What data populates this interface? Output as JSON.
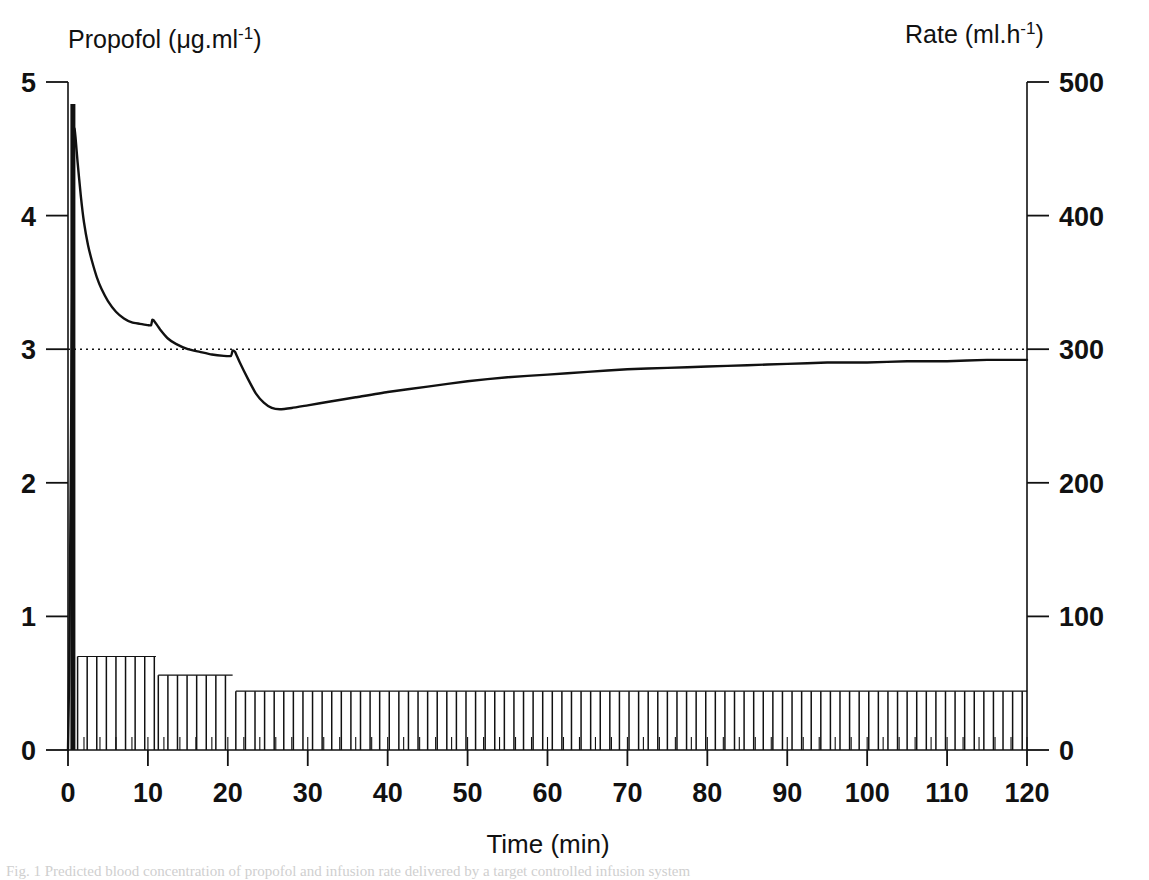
{
  "figure": {
    "left_axis_label_main": "Propofol (",
    "left_axis_label_unit": "μg.ml",
    "left_axis_label_exp": "-1",
    "left_axis_label_close": ")",
    "right_axis_label_main": "Rate (ml.h",
    "right_axis_label_exp": "-1",
    "right_axis_label_close": ")",
    "x_axis_label": "Time (min)",
    "footer_caption": "Fig. 1 Predicted blood concentration of propofol and infusion rate delivered by a target controlled infusion system"
  },
  "chart_data": {
    "type": "line",
    "title": "",
    "xlabel": "Time (min)",
    "ylabel": "Propofol (μg.ml-1)",
    "y2label": "Rate (ml.h-1)",
    "xlim": [
      0,
      120
    ],
    "ylim": [
      0,
      5
    ],
    "y2lim": [
      0,
      500
    ],
    "xticks": [
      0,
      10,
      20,
      30,
      40,
      50,
      60,
      70,
      80,
      90,
      100,
      110,
      120
    ],
    "xticklabels": [
      "0",
      "10",
      "20",
      "30",
      "40",
      "50",
      "60",
      "70",
      "80",
      "90",
      "100",
      "110",
      "120"
    ],
    "yticks": [
      0,
      1,
      2,
      3,
      4,
      5
    ],
    "yticklabels": [
      "0",
      "1",
      "2",
      "3",
      "4",
      "5"
    ],
    "y2ticks": [
      0,
      100,
      200,
      300,
      400,
      500
    ],
    "y2ticklabels": [
      "0",
      "100",
      "200",
      "300",
      "400",
      "500"
    ],
    "x_minor_tick_interval": 2,
    "grid": false,
    "legend": null,
    "reference_line": {
      "name": "target-concentration",
      "axis": "y",
      "value": 3.0,
      "style": "dotted"
    },
    "series": [
      {
        "name": "Predicted blood propofol concentration",
        "axis": "left",
        "style": "solid-line",
        "points": [
          [
            0.0,
            0.0
          ],
          [
            0.15,
            0.6
          ],
          [
            0.3,
            1.7
          ],
          [
            0.45,
            2.9
          ],
          [
            0.6,
            3.9
          ],
          [
            0.72,
            4.45
          ],
          [
            0.8,
            4.65
          ],
          [
            0.95,
            4.58
          ],
          [
            1.2,
            4.4
          ],
          [
            1.6,
            4.15
          ],
          [
            2.0,
            3.95
          ],
          [
            2.5,
            3.78
          ],
          [
            3.0,
            3.66
          ],
          [
            3.6,
            3.54
          ],
          [
            4.2,
            3.45
          ],
          [
            5.0,
            3.36
          ],
          [
            6.0,
            3.28
          ],
          [
            7.0,
            3.23
          ],
          [
            8.0,
            3.2
          ],
          [
            9.0,
            3.19
          ],
          [
            10.0,
            3.18
          ],
          [
            10.4,
            3.18
          ],
          [
            10.55,
            3.22
          ],
          [
            10.8,
            3.21
          ],
          [
            11.5,
            3.15
          ],
          [
            12.5,
            3.08
          ],
          [
            13.5,
            3.04
          ],
          [
            15.0,
            3.0
          ],
          [
            16.5,
            2.98
          ],
          [
            18.0,
            2.96
          ],
          [
            19.5,
            2.95
          ],
          [
            20.4,
            2.95
          ],
          [
            20.6,
            2.99
          ],
          [
            20.9,
            2.98
          ],
          [
            21.5,
            2.9
          ],
          [
            22.5,
            2.78
          ],
          [
            23.5,
            2.67
          ],
          [
            24.5,
            2.6
          ],
          [
            25.5,
            2.56
          ],
          [
            26.5,
            2.55
          ],
          [
            28.0,
            2.56
          ],
          [
            30.0,
            2.58
          ],
          [
            33.0,
            2.61
          ],
          [
            36.0,
            2.64
          ],
          [
            40.0,
            2.68
          ],
          [
            45.0,
            2.72
          ],
          [
            50.0,
            2.76
          ],
          [
            55.0,
            2.79
          ],
          [
            60.0,
            2.81
          ],
          [
            65.0,
            2.83
          ],
          [
            70.0,
            2.85
          ],
          [
            75.0,
            2.86
          ],
          [
            80.0,
            2.87
          ],
          [
            85.0,
            2.88
          ],
          [
            90.0,
            2.89
          ],
          [
            95.0,
            2.9
          ],
          [
            100.0,
            2.9
          ],
          [
            105.0,
            2.91
          ],
          [
            110.0,
            2.91
          ],
          [
            115.0,
            2.92
          ],
          [
            120.0,
            2.92
          ]
        ]
      },
      {
        "name": "Bolus dose",
        "axis": "right",
        "style": "filled-bar",
        "x_start": 0.3,
        "x_end": 0.9,
        "value": 500
      },
      {
        "name": "Infusion rate",
        "axis": "right",
        "style": "vertical-hatch-bars",
        "steps": [
          {
            "x_start": 1.2,
            "x_end": 11.0,
            "rate": 70
          },
          {
            "x_start": 11.3,
            "x_end": 20.6,
            "rate": 56
          },
          {
            "x_start": 21.0,
            "x_end": 120.0,
            "rate": 44
          }
        ],
        "bar_spacing_min": 1.2
      }
    ]
  }
}
